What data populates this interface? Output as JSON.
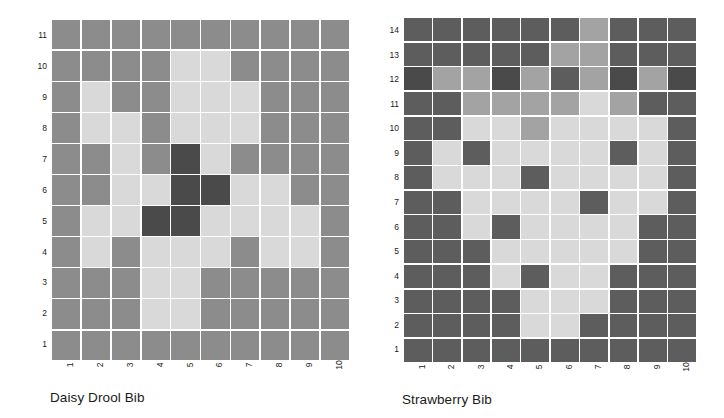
{
  "figure": {
    "background": "#ffffff",
    "gridline_color": "#ffffff",
    "text_color": "#1a1a1a"
  },
  "palette": {
    "dark": "#4a4a4a",
    "mid_dark": "#5d5d5d",
    "mid": "#8c8c8c",
    "mid_light": "#a3a3a3",
    "light": "#d9d9d9",
    "pale": "#e4e4e4"
  },
  "chart_data": [
    {
      "type": "heatmap",
      "id": "daisy-drool-bib",
      "title": "Daisy Drool Bib",
      "xlabel": "",
      "ylabel": "",
      "grid": true,
      "legend": "none",
      "columns": 10,
      "rows": 11,
      "x_ticklabels": [
        "1",
        "2",
        "3",
        "4",
        "5",
        "6",
        "7",
        "8",
        "9",
        "10"
      ],
      "y_ticklabels": [
        "1",
        "2",
        "3",
        "4",
        "5",
        "6",
        "7",
        "8",
        "9",
        "10",
        "11"
      ],
      "xlim": [
        1,
        10
      ],
      "ylim": [
        1,
        11
      ],
      "value_colors": {
        "0": "#8c8c8c",
        "1": "#d9d9d9",
        "2": "#4a4a4a"
      },
      "rows_top_to_bottom": [
        [
          0,
          0,
          0,
          0,
          0,
          0,
          0,
          0,
          0,
          0
        ],
        [
          0,
          0,
          0,
          0,
          1,
          1,
          0,
          0,
          0,
          0
        ],
        [
          0,
          1,
          0,
          0,
          1,
          1,
          1,
          0,
          0,
          0
        ],
        [
          0,
          1,
          1,
          0,
          1,
          1,
          1,
          0,
          0,
          0
        ],
        [
          0,
          0,
          1,
          0,
          2,
          1,
          0,
          0,
          0,
          0
        ],
        [
          0,
          0,
          1,
          1,
          2,
          2,
          1,
          1,
          0,
          0
        ],
        [
          0,
          1,
          1,
          2,
          2,
          1,
          1,
          1,
          1,
          0
        ],
        [
          0,
          1,
          0,
          1,
          1,
          1,
          0,
          1,
          1,
          0
        ],
        [
          0,
          0,
          0,
          1,
          1,
          0,
          0,
          0,
          0,
          0
        ],
        [
          0,
          0,
          0,
          1,
          1,
          0,
          0,
          0,
          0,
          0
        ],
        [
          0,
          0,
          0,
          0,
          0,
          0,
          0,
          0,
          0,
          0
        ]
      ]
    },
    {
      "type": "heatmap",
      "id": "strawberry-bib",
      "title": "Strawberry Bib",
      "xlabel": "",
      "ylabel": "",
      "grid": true,
      "legend": "none",
      "columns": 10,
      "rows": 14,
      "x_ticklabels": [
        "1",
        "2",
        "3",
        "4",
        "5",
        "6",
        "7",
        "8",
        "9",
        "10"
      ],
      "y_ticklabels": [
        "1",
        "2",
        "3",
        "4",
        "5",
        "6",
        "7",
        "8",
        "9",
        "10",
        "11",
        "12",
        "13",
        "14"
      ],
      "xlim": [
        1,
        10
      ],
      "ylim": [
        1,
        14
      ],
      "value_colors": {
        "0": "#5d5d5d",
        "1": "#d9d9d9",
        "2": "#a3a3a3",
        "3": "#4a4a4a"
      },
      "rows_top_to_bottom": [
        [
          0,
          0,
          0,
          0,
          0,
          0,
          2,
          0,
          0,
          0
        ],
        [
          0,
          0,
          0,
          0,
          0,
          2,
          2,
          0,
          0,
          0
        ],
        [
          3,
          2,
          2,
          3,
          2,
          0,
          2,
          3,
          2,
          3
        ],
        [
          0,
          0,
          2,
          2,
          2,
          2,
          1,
          2,
          0,
          0
        ],
        [
          0,
          0,
          1,
          1,
          2,
          1,
          1,
          1,
          1,
          0
        ],
        [
          0,
          1,
          0,
          1,
          1,
          1,
          1,
          0,
          1,
          0
        ],
        [
          0,
          1,
          1,
          1,
          0,
          1,
          1,
          1,
          1,
          0
        ],
        [
          0,
          0,
          1,
          1,
          1,
          1,
          0,
          1,
          1,
          0
        ],
        [
          0,
          0,
          1,
          0,
          1,
          1,
          1,
          1,
          0,
          0
        ],
        [
          0,
          0,
          0,
          1,
          1,
          1,
          1,
          1,
          0,
          0
        ],
        [
          0,
          0,
          0,
          1,
          0,
          1,
          1,
          0,
          0,
          0
        ],
        [
          0,
          0,
          0,
          0,
          1,
          1,
          1,
          0,
          0,
          0
        ],
        [
          0,
          0,
          0,
          0,
          1,
          1,
          0,
          0,
          0,
          0
        ],
        [
          0,
          0,
          0,
          0,
          0,
          0,
          0,
          0,
          0,
          0
        ]
      ]
    }
  ]
}
